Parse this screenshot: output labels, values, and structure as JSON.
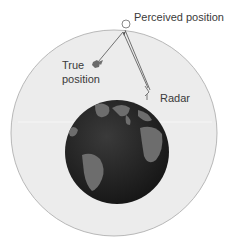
{
  "diagram": {
    "labels": {
      "perceived": "Perceived position",
      "true_line1": "True",
      "true_line2": "position",
      "radar": "Radar"
    },
    "colors": {
      "atmosphere": "#ececec",
      "atmosphere_edge": "#b8b8b8",
      "ocean": "#2a2a2a",
      "land": "#6d6d6d",
      "line": "#707070"
    }
  }
}
